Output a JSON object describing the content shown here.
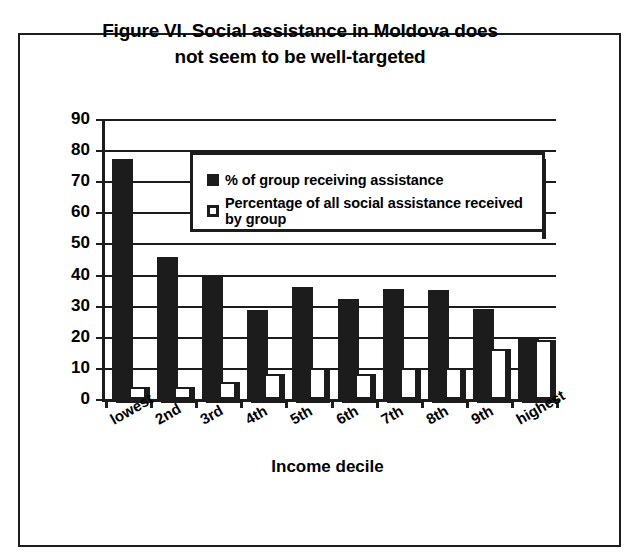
{
  "figure": {
    "title_line1": "Figure VI. Social assistance in Moldova does",
    "title_line2": "not seem to be well-targeted"
  },
  "legend": {
    "series1_label": "% of group receiving assistance",
    "series2_label": "Percentage of all social assistance received by group"
  },
  "axes": {
    "ylabel": "percent",
    "xlabel": "Income decile",
    "yticks": [
      "90",
      "80",
      "70",
      "60",
      "50",
      "40",
      "30",
      "20",
      "10",
      "0"
    ]
  },
  "chart_data": {
    "type": "bar",
    "title": "Figure VI. Social assistance in Moldova does not seem to be well-targeted",
    "xlabel": "Income decile",
    "ylabel": "percent",
    "ylim": [
      0,
      90
    ],
    "ytick_step": 10,
    "grid": true,
    "legend_position": "upper-center-inside",
    "categories": [
      "lowest",
      "2nd",
      "3rd",
      "4th",
      "5th",
      "6th",
      "7th",
      "8th",
      "9th",
      "highest"
    ],
    "series": [
      {
        "name": "% of group receiving assistance",
        "color": "#1c1c1c",
        "values": [
          77,
          45.5,
          40,
          28.5,
          36,
          32,
          35.5,
          35,
          29,
          20
        ]
      },
      {
        "name": "Percentage of all social assistance received by group",
        "color": "#ffffff",
        "values": [
          4,
          4,
          5.5,
          8,
          10,
          8,
          10,
          10,
          16,
          19
        ]
      }
    ]
  }
}
